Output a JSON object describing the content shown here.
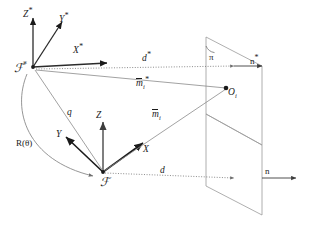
{
  "figure": {
    "background": "#ffffff",
    "stroke_dark": "#1a1a1a",
    "stroke_light": "#8c8c8c",
    "stroke_mid": "#555555",
    "width": 310,
    "height": 237
  },
  "labels": {
    "frame_star_origin": "ℱ",
    "frame_star_origin_star": "*",
    "axis_z_star": "Z",
    "axis_y_star": "Y",
    "axis_x_star": "X",
    "star_mark": "*",
    "frame_origin": "ℱ",
    "axis_z": "Z",
    "axis_y": "Y",
    "axis_x": "X",
    "vector_d_star": "d",
    "vector_d": "d",
    "vector_m_star": "m",
    "vector_m": "m",
    "subscript_i": "i",
    "vector_q": "q",
    "rotation": "R(θ)",
    "plane_pi": "π",
    "normal_star": "n",
    "normal": "n",
    "point_o": "O"
  }
}
